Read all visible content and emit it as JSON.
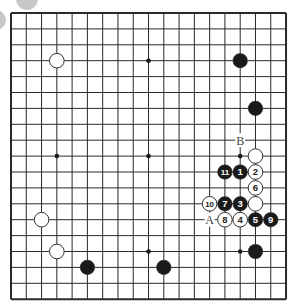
{
  "diagram": {
    "type": "go-board",
    "size": 19,
    "origin": {
      "x": 11,
      "y": 13
    },
    "spacing": {
      "x": 15.28,
      "y": 15.9
    },
    "colors": {
      "line": "#2a2a2a",
      "black": "#1a1a1a",
      "white": "#ffffff",
      "stone_outline": "#333333",
      "background": "#ffffff",
      "decor": "#c8c8c8"
    },
    "star_points": [
      [
        3,
        3
      ],
      [
        9,
        3
      ],
      [
        15,
        3
      ],
      [
        3,
        9
      ],
      [
        9,
        9
      ],
      [
        15,
        9
      ],
      [
        3,
        15
      ],
      [
        9,
        15
      ],
      [
        15,
        15
      ]
    ],
    "stones": [
      {
        "col": 3,
        "row": 3,
        "color": "white",
        "label": ""
      },
      {
        "col": 15,
        "row": 3,
        "color": "black",
        "label": ""
      },
      {
        "col": 16,
        "row": 6,
        "color": "black",
        "label": ""
      },
      {
        "col": 16,
        "row": 9,
        "color": "white",
        "label": ""
      },
      {
        "col": 14,
        "row": 10,
        "color": "black",
        "label": "11"
      },
      {
        "col": 15,
        "row": 10,
        "color": "black",
        "label": "1"
      },
      {
        "col": 16,
        "row": 10,
        "color": "white",
        "label": "2"
      },
      {
        "col": 16,
        "row": 11,
        "color": "white",
        "label": "6"
      },
      {
        "col": 13,
        "row": 12,
        "color": "white",
        "label": "10"
      },
      {
        "col": 14,
        "row": 12,
        "color": "black",
        "label": "7"
      },
      {
        "col": 15,
        "row": 12,
        "color": "black",
        "label": "3"
      },
      {
        "col": 16,
        "row": 12,
        "color": "white",
        "label": ""
      },
      {
        "col": 14,
        "row": 13,
        "color": "white",
        "label": "8"
      },
      {
        "col": 15,
        "row": 13,
        "color": "white",
        "label": "4"
      },
      {
        "col": 16,
        "row": 13,
        "color": "black",
        "label": "5"
      },
      {
        "col": 17,
        "row": 13,
        "color": "black",
        "label": "9"
      },
      {
        "col": 2,
        "row": 13,
        "color": "white",
        "label": ""
      },
      {
        "col": 3,
        "row": 15,
        "color": "white",
        "label": ""
      },
      {
        "col": 16,
        "row": 15,
        "color": "black",
        "label": ""
      },
      {
        "col": 5,
        "row": 16,
        "color": "black",
        "label": ""
      },
      {
        "col": 10,
        "row": 16,
        "color": "black",
        "label": ""
      }
    ],
    "markers": [
      {
        "col": 15,
        "row": 8,
        "text": "B"
      },
      {
        "col": 13,
        "row": 13,
        "text": "A"
      }
    ]
  }
}
